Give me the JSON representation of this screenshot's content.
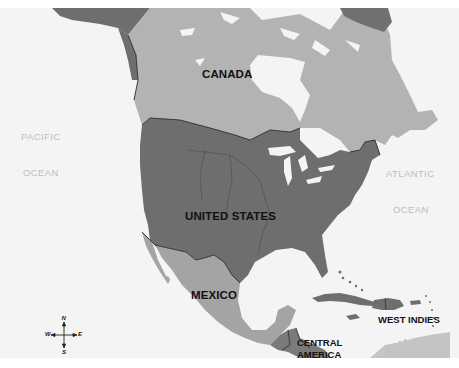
{
  "map": {
    "title": "North America",
    "colors": {
      "water": "#f3f3f3",
      "canada": "#b3b3b3",
      "united_states": "#6e6e6e",
      "mexico": "#a4a4a4",
      "central_america": "#7a7a7a",
      "west_indies": "#6e6e6e",
      "greenland": "#707070",
      "south_america": "#c4c4c4",
      "borders": "#2a2a2a"
    },
    "labels": {
      "canada": "CANADA",
      "united_states": "UNITED STATES",
      "mexico": "MEXICO",
      "central_america_1": "CENTRAL",
      "central_america_2": "AMERICA",
      "west_indies": "WEST INDIES",
      "pacific_1": "PACIFIC",
      "pacific_2": "OCEAN",
      "atlantic_1": "ATLANTIC",
      "atlantic_2": "OCEAN"
    },
    "compass": {
      "n": "N",
      "s": "S",
      "e": "E",
      "w": "W"
    }
  }
}
